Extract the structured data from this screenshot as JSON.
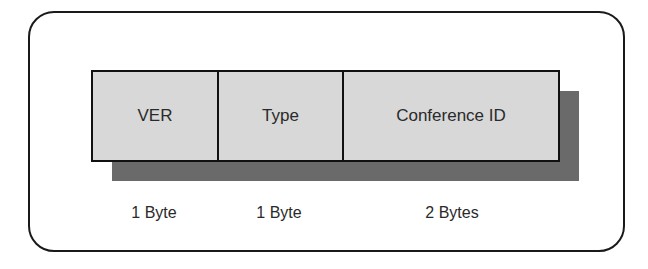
{
  "diagram": {
    "type": "packet-header-format",
    "fields": [
      {
        "label": "VER",
        "size": "1 Byte"
      },
      {
        "label": "Type",
        "size": "1 Byte"
      },
      {
        "label": "Conference ID",
        "size": "2 Bytes"
      }
    ]
  }
}
